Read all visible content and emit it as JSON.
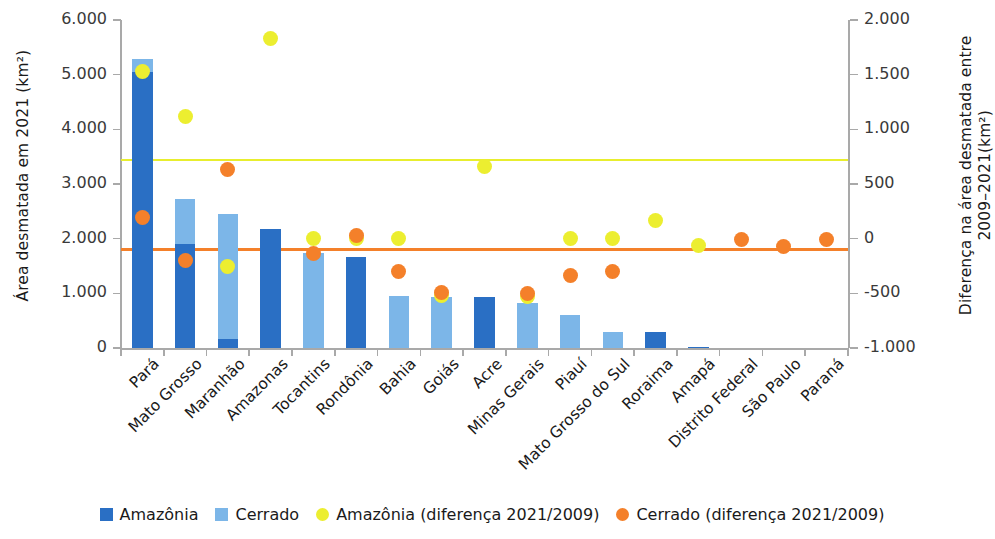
{
  "chart_data": {
    "type": "bar",
    "title": "",
    "subtitle": "",
    "categories": [
      "Pará",
      "Mato Grosso",
      "Maranhão",
      "Amazonas",
      "Tocantins",
      "Rondônia",
      "Bahia",
      "Goiás",
      "Acre",
      "Minas Gerais",
      "Piauí",
      "Mato Grosso do Sul",
      "Roraima",
      "Amapá",
      "Distrito Federal",
      "São Paulo",
      "Paraná"
    ],
    "series": [
      {
        "name": "Amazônia",
        "type": "bar-stack",
        "color": "#2a6fc4",
        "axis": "left",
        "values": [
          5050,
          1900,
          170,
          2170,
          0,
          1660,
          0,
          0,
          930,
          0,
          0,
          0,
          290,
          20,
          0,
          0,
          0
        ]
      },
      {
        "name": "Cerrado",
        "type": "bar-stack",
        "color": "#7cb6e8",
        "axis": "left",
        "values": [
          230,
          830,
          2280,
          0,
          1740,
          0,
          960,
          930,
          0,
          820,
          600,
          290,
          0,
          0,
          0,
          0,
          0
        ]
      },
      {
        "name": "Amazônia (diferença 2021/2009)",
        "type": "scatter",
        "color": "#ecee30",
        "axis": "right",
        "values": [
          1530,
          1120,
          -250,
          1830,
          0,
          0,
          0,
          -520,
          660,
          -530,
          0,
          0,
          170,
          -60,
          null,
          null,
          null
        ]
      },
      {
        "name": "Cerrado (diferença 2021/2009)",
        "type": "scatter",
        "color": "#f4802a",
        "axis": "right",
        "values": [
          190,
          -200,
          630,
          null,
          -140,
          30,
          -300,
          -490,
          null,
          -500,
          -340,
          -300,
          null,
          null,
          -10,
          -70,
          -10
        ]
      }
    ],
    "reference_lines": [
      {
        "name": "Amazônia média",
        "color": "#e8ee2e",
        "axis": "right",
        "value": 720
      },
      {
        "name": "Cerrado média",
        "color": "#f4802a",
        "axis": "right",
        "value": -100
      }
    ],
    "left_axis": {
      "label": "Área desmatada em 2021 (km²)",
      "ticks": [
        "0",
        "1.000",
        "2.000",
        "3.000",
        "4.000",
        "5.000",
        "6.000"
      ],
      "tickvalues": [
        0,
        1000,
        2000,
        3000,
        4000,
        5000,
        6000
      ],
      "min": 0,
      "max": 6000
    },
    "right_axis": {
      "label_line1": "Diferença na área desmatada entre",
      "label_line2": "2009–2021(km²)",
      "ticks": [
        "-1.000",
        "-500",
        "0",
        "500",
        "1.000",
        "1.500",
        "2.000"
      ],
      "tickvalues": [
        -1000,
        -500,
        0,
        500,
        1000,
        1500,
        2000
      ],
      "min": -1000,
      "max": 2000
    },
    "xlabel": "",
    "grid": false,
    "legend_position": "bottom"
  },
  "legend": {
    "items": [
      {
        "label": "Amazônia",
        "marker": "square",
        "color": "#2a6fc4"
      },
      {
        "label": "Cerrado",
        "marker": "square",
        "color": "#7cb6e8"
      },
      {
        "label": "Amazônia (diferença 2021/2009)",
        "marker": "circle",
        "color": "#ecee30"
      },
      {
        "label": "Cerrado (diferença 2021/2009)",
        "marker": "circle",
        "color": "#f4802a"
      }
    ]
  }
}
